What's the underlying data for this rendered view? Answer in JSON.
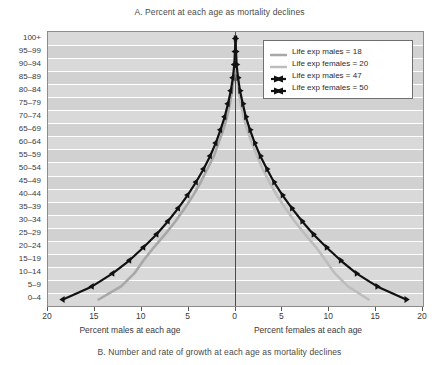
{
  "figure": {
    "title_a": "A. Percent at each age as mortality declines",
    "title_b": "B. Number and rate of growth at each age as mortality declines"
  },
  "axes": {
    "left_caption": "Percent males at each age",
    "right_caption": "Percent females at each age",
    "x_tick_labels": [
      "20",
      "15",
      "10",
      "5",
      "0",
      "5",
      "10",
      "15",
      "20"
    ],
    "y_tick_labels": [
      "100+",
      "95–99",
      "90–94",
      "85–89",
      "80–84",
      "75–79",
      "70–74",
      "65–69",
      "60–64",
      "55–59",
      "50–54",
      "45–49",
      "40–44",
      "35–39",
      "30–34",
      "25–29",
      "20–24",
      "15–19",
      "10–14",
      "5–9",
      "0–4"
    ]
  },
  "legend": {
    "items": [
      {
        "label": "Life exp males = 18",
        "style": "grey-line",
        "color": "#a8a8a8"
      },
      {
        "label": "Life exp females = 20",
        "style": "grey-line",
        "color": "#bdbdbd"
      },
      {
        "label": "Life exp males = 47",
        "style": "black-marker",
        "color": "#111111"
      },
      {
        "label": "Life exp females = 50",
        "style": "black-marker",
        "color": "#111111"
      }
    ]
  },
  "chart_data": {
    "type": "line",
    "title": "A. Percent at each age as mortality declines",
    "xlabel": "Percent at each age",
    "ylabel": "Age group",
    "xlim": [
      -20,
      20
    ],
    "grid": true,
    "legend_position": "top-right",
    "categories": [
      "0–4",
      "5–9",
      "10–14",
      "15–19",
      "20–24",
      "25–29",
      "30–34",
      "35–39",
      "40–44",
      "45–49",
      "50–54",
      "55–59",
      "60–64",
      "65–69",
      "70–74",
      "75–79",
      "80–84",
      "85–89",
      "90–94",
      "95–99",
      "100+"
    ],
    "series": [
      {
        "name": "Life exp males = 18",
        "side": "left",
        "color": "#a8a8a8",
        "markers": false,
        "values": [
          14.6,
          12.2,
          10.8,
          9.8,
          8.7,
          7.5,
          6.4,
          5.4,
          4.5,
          3.7,
          3.0,
          2.3,
          1.8,
          1.3,
          0.9,
          0.6,
          0.35,
          0.18,
          0.08,
          0.03,
          0.0
        ]
      },
      {
        "name": "Life exp females = 20",
        "side": "right",
        "color": "#bdbdbd",
        "markers": false,
        "values": [
          14.2,
          12.0,
          10.6,
          9.6,
          8.6,
          7.4,
          6.3,
          5.3,
          4.4,
          3.6,
          2.9,
          2.3,
          1.75,
          1.25,
          0.85,
          0.55,
          0.32,
          0.16,
          0.07,
          0.03,
          0.0
        ]
      },
      {
        "name": "Life exp males = 47",
        "side": "left",
        "color": "#111111",
        "markers": true,
        "values": [
          18.4,
          15.3,
          13.1,
          11.3,
          9.8,
          8.4,
          7.2,
          6.1,
          5.1,
          4.2,
          3.4,
          2.7,
          2.1,
          1.6,
          1.15,
          0.8,
          0.5,
          0.28,
          0.13,
          0.05,
          0.0
        ]
      },
      {
        "name": "Life exp females = 50",
        "side": "right",
        "color": "#111111",
        "markers": true,
        "values": [
          18.2,
          15.1,
          12.9,
          11.2,
          9.7,
          8.3,
          7.1,
          6.0,
          5.0,
          4.1,
          3.35,
          2.65,
          2.05,
          1.55,
          1.1,
          0.78,
          0.48,
          0.27,
          0.12,
          0.05,
          0.0
        ]
      }
    ]
  },
  "colors": {
    "plot_background": "#d9d9d9",
    "gridline": "#ffffff",
    "frame": "#8c8c8c",
    "grey_series": "#a8a8a8",
    "black_series": "#111111"
  }
}
